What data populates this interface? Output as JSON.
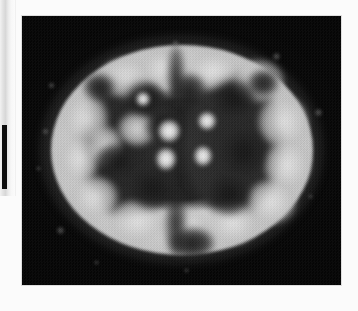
{
  "page": {
    "background_color": "#fbfbfb",
    "type": "scanned-journal-page"
  },
  "left_strip": {
    "name": "partial-adjacent-figure",
    "description": "sliver of a neighbouring printed figure cropped at the left page edge",
    "bar_color": "#0c0c0c",
    "gradient_color": "#d7d7d7"
  },
  "figure": {
    "name": "brain-scan",
    "modality": "PET",
    "view": "axial",
    "frame_color": "#050505",
    "frame": {
      "x": 22,
      "y": 16,
      "width": 319,
      "height": 269
    },
    "rendering": "grayscale halftone print",
    "regions": [
      {
        "name": "cortical-ribbon",
        "intensity": "high",
        "tone": "#d8d8d8"
      },
      {
        "name": "white-matter",
        "intensity": "low",
        "tone": "#1f1f1f"
      },
      {
        "name": "basal-ganglia-thalamus",
        "intensity": "very-high",
        "tone": "#f6f6f6"
      },
      {
        "name": "interhemispheric-fissure",
        "intensity": "very-low",
        "tone": "#121212"
      },
      {
        "name": "scalp-halo",
        "intensity": "medium-low",
        "tone": "#6e6e6e"
      },
      {
        "name": "background",
        "intensity": "none",
        "tone": "#050505"
      }
    ],
    "gyri": [
      {
        "x": 78,
        "y": 42,
        "w": 52,
        "h": 40
      },
      {
        "x": 120,
        "y": 34,
        "w": 44,
        "h": 36
      },
      {
        "x": 166,
        "y": 36,
        "w": 50,
        "h": 38
      },
      {
        "x": 210,
        "y": 44,
        "w": 52,
        "h": 42
      },
      {
        "x": 42,
        "y": 78,
        "w": 44,
        "h": 50
      },
      {
        "x": 38,
        "y": 120,
        "w": 40,
        "h": 46
      },
      {
        "x": 50,
        "y": 160,
        "w": 46,
        "h": 42
      },
      {
        "x": 236,
        "y": 80,
        "w": 50,
        "h": 52
      },
      {
        "x": 242,
        "y": 124,
        "w": 46,
        "h": 50
      },
      {
        "x": 224,
        "y": 164,
        "w": 50,
        "h": 44
      },
      {
        "x": 88,
        "y": 184,
        "w": 54,
        "h": 42
      },
      {
        "x": 140,
        "y": 192,
        "w": 48,
        "h": 40
      },
      {
        "x": 186,
        "y": 186,
        "w": 50,
        "h": 42
      },
      {
        "x": 96,
        "y": 96,
        "w": 38,
        "h": 34
      },
      {
        "x": 66,
        "y": 110,
        "w": 34,
        "h": 40
      }
    ],
    "sulci": [
      {
        "x": 104,
        "y": 66,
        "w": 40,
        "h": 34
      },
      {
        "x": 150,
        "y": 58,
        "w": 34,
        "h": 32
      },
      {
        "x": 190,
        "y": 64,
        "w": 44,
        "h": 38
      },
      {
        "x": 74,
        "y": 128,
        "w": 42,
        "h": 34
      },
      {
        "x": 108,
        "y": 150,
        "w": 46,
        "h": 44
      },
      {
        "x": 198,
        "y": 112,
        "w": 46,
        "h": 48
      },
      {
        "x": 186,
        "y": 158,
        "w": 42,
        "h": 40
      },
      {
        "x": 124,
        "y": 96,
        "w": 34,
        "h": 30
      },
      {
        "x": 148,
        "y": 212,
        "w": 44,
        "h": 30
      },
      {
        "x": 226,
        "y": 54,
        "w": 30,
        "h": 26
      },
      {
        "x": 62,
        "y": 58,
        "w": 30,
        "h": 26
      }
    ],
    "hot_spots": [
      {
        "name": "left-thalamus",
        "x": 136,
        "y": 104,
        "w": 22,
        "h": 22
      },
      {
        "name": "left-putamen",
        "x": 134,
        "y": 132,
        "w": 20,
        "h": 22
      },
      {
        "name": "right-caudate",
        "x": 176,
        "y": 96,
        "w": 18,
        "h": 18
      },
      {
        "name": "right-thalamus",
        "x": 172,
        "y": 130,
        "w": 18,
        "h": 20
      },
      {
        "name": "focal-nucleus",
        "x": 114,
        "y": 76,
        "w": 14,
        "h": 14
      }
    ]
  }
}
